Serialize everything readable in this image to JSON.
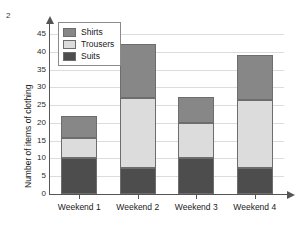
{
  "question_number": "2",
  "chart_data": {
    "type": "bar",
    "stacked": true,
    "title": "",
    "xlabel": "",
    "ylabel": "Number of items of clothing",
    "categories": [
      "Weekend 1",
      "Weekend 2",
      "Weekend 3",
      "Weekend 4"
    ],
    "series": [
      {
        "name": "Suits",
        "values": [
          10,
          7.3,
          10,
          7.3
        ],
        "color": "#4d4d4d"
      },
      {
        "name": "Trousers",
        "values": [
          5.7,
          19.7,
          10,
          19.2
        ],
        "color": "#dcdcdc"
      },
      {
        "name": "Shirts",
        "values": [
          6.3,
          15.3,
          7.2,
          12.7
        ],
        "color": "#878787"
      }
    ],
    "cumulative_tops": {
      "Weekend 1": {
        "suits": 10,
        "trousers": 15.7,
        "total": 22
      },
      "Weekend 2": {
        "suits": 7.3,
        "trousers": 27,
        "total": 42.3
      },
      "Weekend 3": {
        "suits": 10,
        "trousers": 20,
        "total": 27.2
      },
      "Weekend 4": {
        "suits": 7.3,
        "trousers": 26.5,
        "total": 39.2
      }
    },
    "ylim": [
      0,
      47
    ],
    "yticks": [
      0,
      5,
      10,
      15,
      20,
      25,
      30,
      35,
      40,
      45
    ],
    "ytick_labels": [
      "0",
      "5",
      "10",
      "15",
      "20",
      "25",
      "30",
      "35",
      "40",
      "45"
    ],
    "grid": true,
    "grid_axis": "y",
    "legend_position": "top-left",
    "legend_order": [
      "Shirts",
      "Trousers",
      "Suits"
    ],
    "axis_arrows": true,
    "colors": {
      "shirts": "#878787",
      "trousers": "#dcdcdc",
      "suits": "#4d4d4d",
      "gridline": "#dcdcdc",
      "axis": "#555555",
      "bar_outline": "#6d6d6d"
    }
  }
}
